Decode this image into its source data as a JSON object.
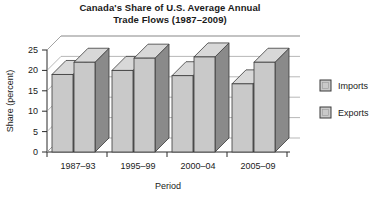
{
  "chart_data": {
    "type": "bar",
    "title": "Canada's Share of U.S. Average Annual Trade Flows (1987–2009)",
    "title_lines": [
      "Canada's Share of U.S. Average Annual",
      "Trade Flows (1987–2009)"
    ],
    "xlabel": "Period",
    "ylabel": "Share (percent)",
    "categories": [
      "1987–93",
      "1995–99",
      "2000–04",
      "2005–09"
    ],
    "series": [
      {
        "name": "Imports",
        "values": [
          19.0,
          20.0,
          18.7,
          16.7
        ],
        "color": "#c9c9c9"
      },
      {
        "name": "Exports",
        "values": [
          22.0,
          23.0,
          23.3,
          22.0
        ],
        "color": "#c9c9c9"
      }
    ],
    "ylim": [
      0,
      25
    ],
    "yticks": [
      0,
      5,
      10,
      15,
      20,
      25
    ],
    "ytick_labels": [
      "0",
      "5",
      "10",
      "15",
      "20",
      "25"
    ],
    "grid": true,
    "legend_position": "right",
    "style": "3d-bar",
    "colors": {
      "bar_face": "#c9c9c9",
      "bar_top": "#d8d8d8",
      "bar_side": "#8a8a8a",
      "bar_edge": "#3a3a3a",
      "gridline": "#9a9a9a",
      "axis": "#2a2a2a",
      "background": "#ffffff",
      "text": "#1a1a1a"
    }
  },
  "legend": {
    "items": [
      {
        "label": "Imports"
      },
      {
        "label": "Exports"
      }
    ]
  }
}
